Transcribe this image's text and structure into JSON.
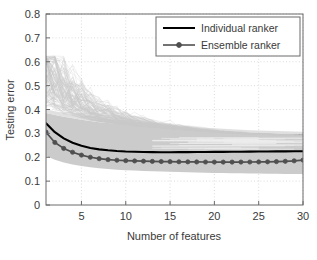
{
  "chart_data": {
    "type": "line",
    "title": "",
    "xlabel": "Number of features",
    "ylabel": "Testing error",
    "xlim": [
      1,
      30
    ],
    "ylim": [
      0,
      0.8
    ],
    "grid": true,
    "legend_position": "top-right",
    "xticks": [
      5,
      10,
      15,
      20,
      25,
      30
    ],
    "xticklabels": [
      "5",
      "10",
      "15",
      "20",
      "25",
      "30"
    ],
    "yticks": [
      0,
      0.1,
      0.2,
      0.3,
      0.4,
      0.5,
      0.6,
      0.7,
      0.8
    ],
    "yticklabels": [
      "0",
      "0.1",
      "0.2",
      "0.3",
      "0.4",
      "0.5",
      "0.6",
      "0.7",
      "0.8"
    ],
    "x": [
      1,
      2,
      3,
      4,
      5,
      6,
      7,
      8,
      9,
      10,
      11,
      12,
      13,
      14,
      15,
      16,
      17,
      18,
      19,
      20,
      21,
      22,
      23,
      24,
      25,
      26,
      27,
      28,
      29,
      30
    ],
    "series": [
      {
        "name": "Individual ranker",
        "style": "solid-line",
        "color": "#000000",
        "marker": "none",
        "values": [
          0.342,
          0.305,
          0.279,
          0.261,
          0.248,
          0.239,
          0.233,
          0.229,
          0.226,
          0.224,
          0.223,
          0.222,
          0.2215,
          0.2212,
          0.2212,
          0.2213,
          0.2215,
          0.2218,
          0.2221,
          0.2224,
          0.2227,
          0.223,
          0.2233,
          0.2236,
          0.2239,
          0.2242,
          0.2245,
          0.2248,
          0.2251,
          0.2254
        ]
      },
      {
        "name": "Ensemble ranker",
        "style": "line-with-markers",
        "color": "#4f4f4f",
        "marker": "circle",
        "values": [
          0.305,
          0.262,
          0.237,
          0.221,
          0.209,
          0.2,
          0.194,
          0.19,
          0.1875,
          0.1858,
          0.1845,
          0.1835,
          0.1827,
          0.182,
          0.1815,
          0.181,
          0.1806,
          0.1803,
          0.18,
          0.1798,
          0.1797,
          0.1797,
          0.1798,
          0.18,
          0.1803,
          0.1808,
          0.1817,
          0.183,
          0.185,
          0.188
        ]
      }
    ],
    "bands": [
      {
        "name": "individual-ranker-spread",
        "color": "#c8c8c8",
        "upper": [
          0.385,
          0.377,
          0.37,
          0.363,
          0.357,
          0.352,
          0.347,
          0.343,
          0.339,
          0.335,
          0.332,
          0.329,
          0.326,
          0.323,
          0.32,
          0.317,
          0.314,
          0.311,
          0.308,
          0.305,
          0.303,
          0.301,
          0.299,
          0.297,
          0.296,
          0.295,
          0.294,
          0.293,
          0.292,
          0.291
        ],
        "lower": [
          0.205,
          0.19,
          0.178,
          0.17,
          0.163,
          0.158,
          0.154,
          0.151,
          0.148,
          0.146,
          0.144,
          0.142,
          0.141,
          0.14,
          0.139,
          0.138,
          0.137,
          0.136,
          0.135,
          0.134,
          0.134,
          0.133,
          0.133,
          0.132,
          0.132,
          0.131,
          0.131,
          0.13,
          0.13,
          0.13
        ]
      }
    ],
    "outlier_traces_note": "faint light-gray individual ranker traces spiking up to about 0.61 for small feature counts"
  },
  "legend": {
    "entries": [
      {
        "label": "Individual ranker"
      },
      {
        "label": "Ensemble ranker"
      }
    ]
  }
}
